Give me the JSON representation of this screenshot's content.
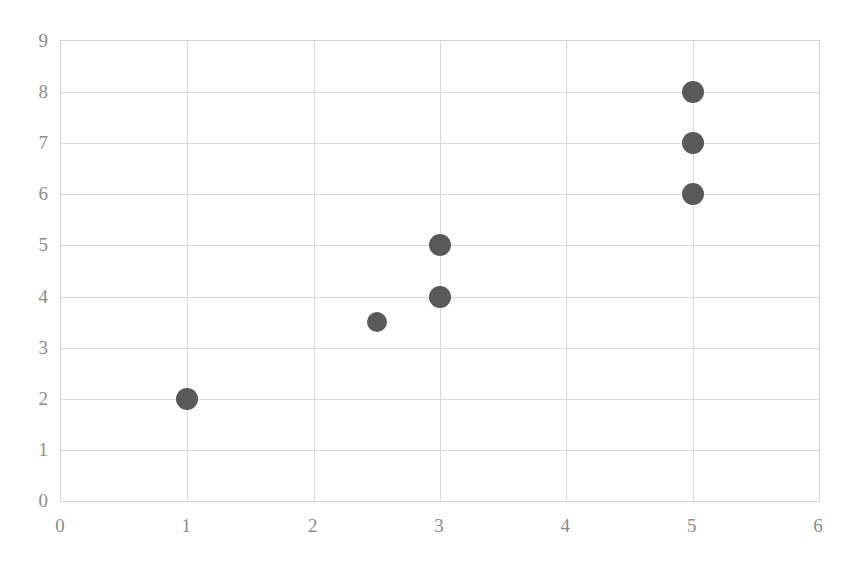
{
  "chart_data": {
    "type": "scatter",
    "title": "",
    "subtitle": "",
    "xlabel": "",
    "ylabel": "",
    "xlim": [
      0,
      6
    ],
    "ylim": [
      0,
      9
    ],
    "xticks": [
      "0",
      "1",
      "2",
      "3",
      "4",
      "5",
      "6"
    ],
    "yticks": [
      "0",
      "1",
      "2",
      "3",
      "4",
      "5",
      "6",
      "7",
      "8",
      "9"
    ],
    "grid": true,
    "legend": "none",
    "series": [
      {
        "name": "series-1",
        "marker": "filled-circle",
        "color": "#595959",
        "points": [
          {
            "x": 1,
            "y": 2,
            "size": 22
          },
          {
            "x": 2.5,
            "y": 3.5,
            "size": 20
          },
          {
            "x": 3,
            "y": 4,
            "size": 22
          },
          {
            "x": 3,
            "y": 5,
            "size": 22
          },
          {
            "x": 5,
            "y": 6,
            "size": 22
          },
          {
            "x": 5,
            "y": 7,
            "size": 22
          },
          {
            "x": 5,
            "y": 8,
            "size": 22
          }
        ]
      }
    ],
    "colors": {
      "marker": "#595959",
      "gridline": "#d9d9d9",
      "plot_border": "#d4d4d4",
      "tick_label": "#8c8c8c",
      "background": "#ffffff"
    }
  }
}
